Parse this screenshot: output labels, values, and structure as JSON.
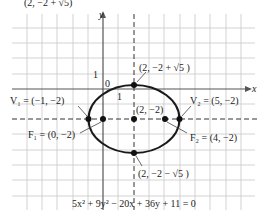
{
  "diagram": {
    "type": "ellipse-graph",
    "top_partial_caption": "(2, −2 + √5)",
    "axes": {
      "x_label": "x",
      "y_label": "y",
      "origin_label": "0",
      "y_tick_label": "1",
      "x_tick_label": "1"
    },
    "equation": "5x² + 9y² − 20x + 36y + 11 = 0",
    "center": {
      "label": "(2, −2)",
      "x": 2,
      "y": -2
    },
    "top_point": {
      "label": "(2, −2 + √5 )"
    },
    "bottom_point": {
      "label": "(2, −2 − √5 )"
    },
    "vertex1": {
      "name": "V₁",
      "label": "V₁ = (−1, −2)",
      "x": -1,
      "y": -2
    },
    "vertex2": {
      "name": "V₂",
      "label": "V₂ = (5, −2)",
      "x": 5,
      "y": -2
    },
    "focus1": {
      "name": "F₁",
      "label": "F₁ = (0, −2)",
      "x": 0,
      "y": -2
    },
    "focus2": {
      "name": "F₂",
      "label": "F₂ = (4, −2)",
      "x": 4,
      "y": -2
    },
    "colors": {
      "grid": "#c8c8c8",
      "axes": "#555555",
      "curve": "#1a1a1a",
      "text": "#222222"
    }
  }
}
